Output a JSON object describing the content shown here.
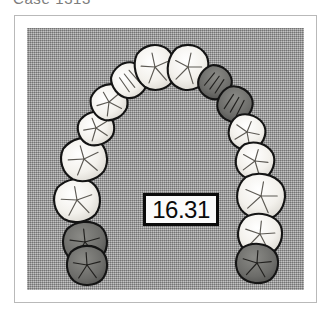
{
  "caption": {
    "text": "Case 1313"
  },
  "figure": {
    "name": "dental-arch-occlusal-view",
    "background_color": "#a8a8a8",
    "frame_border_color": "#b9b9b9",
    "plate_color": "#a8a8a8"
  },
  "measurement": {
    "value": "16.31",
    "box_fill": "#fbfbfb",
    "box_border": "#0b0b0b"
  },
  "teeth": {
    "count": 16,
    "light_fill": "#f2f0ec",
    "shaded_fill": "#6a6a68",
    "outline_color": "#141414",
    "arch_items": [
      {
        "id": "t1",
        "label": "right-second-molar",
        "shaded": true,
        "cx": 58,
        "cy": 214,
        "rx": 23,
        "ry": 21,
        "rot": -6
      },
      {
        "id": "t2",
        "label": "right-first-molar",
        "shaded": false,
        "cx": 50,
        "cy": 172,
        "rx": 24,
        "ry": 22,
        "rot": -10
      },
      {
        "id": "t3",
        "label": "right-second-premolar",
        "shaded": false,
        "cx": 57,
        "cy": 131,
        "rx": 24,
        "ry": 22,
        "rot": -16
      },
      {
        "id": "t4",
        "label": "right-first-premolar",
        "shaded": false,
        "cx": 69,
        "cy": 100,
        "rx": 19,
        "ry": 17,
        "rot": -22
      },
      {
        "id": "t5",
        "label": "right-canine",
        "shaded": false,
        "cx": 82,
        "cy": 74,
        "rx": 19,
        "ry": 18,
        "rot": -30
      },
      {
        "id": "t6",
        "label": "right-lateral-incisor",
        "shaded": false,
        "cx": 102,
        "cy": 52,
        "rx": 18,
        "ry": 18,
        "rot": -38
      },
      {
        "id": "t7",
        "label": "right-central-incisor",
        "shaded": false,
        "cx": 128,
        "cy": 39,
        "rx": 21,
        "ry": 23,
        "rot": -12
      },
      {
        "id": "t8",
        "label": "left-central-incisor",
        "shaded": false,
        "cx": 161,
        "cy": 39,
        "rx": 21,
        "ry": 23,
        "rot": 12
      },
      {
        "id": "t9",
        "label": "left-lateral-incisor",
        "shaded": true,
        "cx": 188,
        "cy": 54,
        "rx": 17,
        "ry": 17,
        "rot": 36
      },
      {
        "id": "t10",
        "label": "left-canine",
        "shaded": true,
        "cx": 208,
        "cy": 76,
        "rx": 18,
        "ry": 18,
        "rot": 30
      },
      {
        "id": "t11",
        "label": "left-first-premolar",
        "shaded": false,
        "cx": 220,
        "cy": 104,
        "rx": 19,
        "ry": 18,
        "rot": 22
      },
      {
        "id": "t12",
        "label": "left-second-premolar",
        "shaded": false,
        "cx": 228,
        "cy": 133,
        "rx": 20,
        "ry": 19,
        "rot": 16
      },
      {
        "id": "t13",
        "label": "left-first-molar",
        "shaded": false,
        "cx": 234,
        "cy": 168,
        "rx": 25,
        "ry": 23,
        "rot": 10
      },
      {
        "id": "t14",
        "label": "left-second-molar",
        "shaded": false,
        "cx": 233,
        "cy": 206,
        "rx": 23,
        "ry": 21,
        "rot": 6
      },
      {
        "id": "t15",
        "label": "left-third-molar",
        "shaded": true,
        "cx": 230,
        "cy": 235,
        "rx": 22,
        "ry": 20,
        "rot": 4
      },
      {
        "id": "t16",
        "label": "right-third-molar",
        "shaded": true,
        "cx": 60,
        "cy": 237,
        "rx": 21,
        "ry": 20,
        "rot": -4
      }
    ]
  }
}
